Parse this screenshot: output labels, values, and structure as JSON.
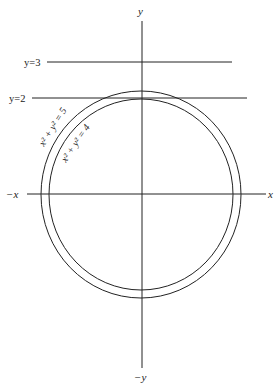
{
  "diagram": {
    "axes": {
      "x_pos_label": "x",
      "x_neg_label": "−x",
      "y_pos_label": "y",
      "y_neg_label": "−y"
    },
    "lines": [
      {
        "label": "y=3",
        "value": 3
      },
      {
        "label": "y=2",
        "value": 2
      }
    ],
    "circles": [
      {
        "label": "x² + y² = 5",
        "radius_squared": 5
      },
      {
        "label": "x² + y² = 4",
        "radius_squared": 4
      }
    ],
    "colors": {
      "stroke": "#222222",
      "background": "#ffffff"
    }
  }
}
